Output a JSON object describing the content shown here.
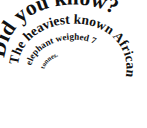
{
  "image": {
    "kind": "spiral-typography-graphic",
    "background_color": "#ffffff",
    "text_color": "#111111",
    "width": 147,
    "height": 128
  },
  "spiral": {
    "full_text": "Did you know? The heaviest known African elephant weighed 7 tonnes.",
    "direction": "clockwise-inward",
    "segments": [
      {
        "id": "segment-1",
        "text": "Did you know?",
        "size_class": "seg-outer",
        "start_offset_pct": 1,
        "note": "outermost turn, largest bold serif, begins at left side"
      },
      {
        "id": "segment-2",
        "text": "The heaviest known African",
        "size_class": "seg-mid",
        "start_offset_pct": 1,
        "note": "second turn, medium bold serif"
      },
      {
        "id": "segment-3",
        "text": "elephant weighed 7",
        "size_class": "seg-inner",
        "start_offset_pct": 2,
        "note": "third turn, small bold serif"
      },
      {
        "id": "segment-4",
        "text": "tonnes.",
        "size_class": "seg-core",
        "start_offset_pct": 2,
        "note": "innermost turn, smallest bold serif, ends near center"
      }
    ]
  }
}
